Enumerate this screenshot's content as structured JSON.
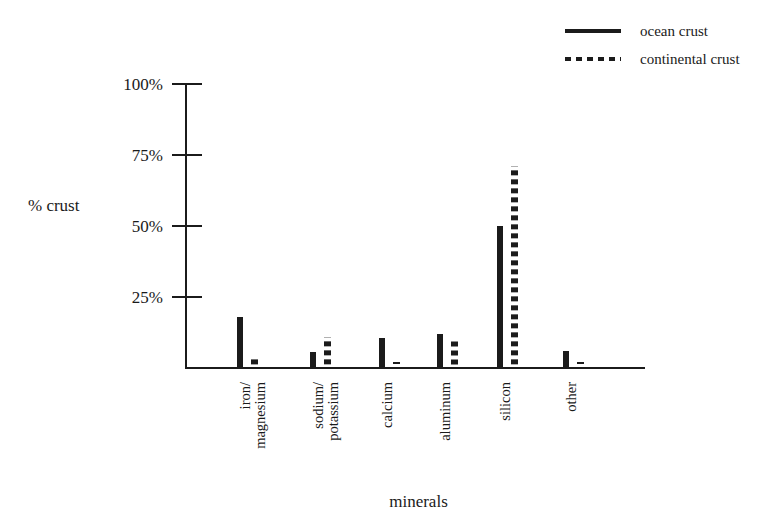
{
  "chart_data": {
    "type": "bar",
    "title": "",
    "xlabel": "minerals",
    "ylabel": "% crust",
    "ylim": [
      0,
      100
    ],
    "yticks": [
      "25%",
      "50%",
      "75%",
      "100%"
    ],
    "ytick_values": [
      25,
      50,
      75,
      100
    ],
    "grid": false,
    "legend_position": "top-right",
    "categories": [
      "iron/ magnesium",
      "sodium/ potassium",
      "calcium",
      "aluminum",
      "silicon",
      "other"
    ],
    "category_lines": [
      [
        "iron/",
        "magnesium"
      ],
      [
        "sodium/",
        "potassium"
      ],
      [
        "calcium",
        ""
      ],
      [
        "aluminum",
        ""
      ],
      [
        "silicon",
        ""
      ],
      [
        "other",
        ""
      ]
    ],
    "series": [
      {
        "name": "ocean crust",
        "style": "solid",
        "values": [
          18,
          5.5,
          10.5,
          12,
          50,
          6
        ]
      },
      {
        "name": "continental crust",
        "style": "dotted",
        "values": [
          4,
          11,
          2,
          10,
          71,
          2
        ]
      }
    ]
  },
  "legend": {
    "entries": [
      {
        "label": "ocean crust",
        "swatch": "solid-line-swatch"
      },
      {
        "label": "continental crust",
        "swatch": "dotted-line-swatch"
      }
    ]
  },
  "axes": {
    "y_title": "% crust",
    "x_title": "minerals",
    "y_ticks": [
      {
        "label": "100%",
        "value": 100
      },
      {
        "label": "75%",
        "value": 75
      },
      {
        "label": "50%",
        "value": 50
      },
      {
        "label": "25%",
        "value": 25
      }
    ]
  },
  "colors": {
    "ink": "#1b1b1b",
    "background": "#ffffff"
  }
}
